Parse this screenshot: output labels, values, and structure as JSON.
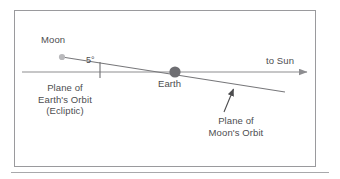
{
  "figure": {
    "kind": "astronomy-diagram",
    "colors": {
      "frame_border": "#9a9a9d",
      "bottom_rule": "#a8a8ab",
      "text": "#4d4d4f",
      "ecliptic_line": "#8d8d90",
      "moon_orbit_line": "#77777a",
      "earth_body": "#6e6e72",
      "moon_body": "#b9b9bc",
      "leader_arrow": "#4d4d4f",
      "background": "#ffffff"
    },
    "labels": {
      "moon": "Moon",
      "angle": "5°",
      "to_sun": "to Sun",
      "earth": "Earth",
      "ecliptic_line1": "Plane of",
      "ecliptic_line2": "Earth's Orbit",
      "ecliptic_line3": "(Ecliptic)",
      "moon_orbit_line1": "Plane of",
      "moon_orbit_line2": "Moon's Orbit"
    },
    "geometry": {
      "ecliptic": {
        "x1": 22,
        "y1": 72,
        "x2": 315,
        "y2": 72,
        "arrow_at": "end"
      },
      "moon_orbit": {
        "x1": 62,
        "y1": 57,
        "x2": 285,
        "y2": 92
      },
      "angle_tick": {
        "x": 100,
        "y1": 62,
        "y2": 78
      },
      "earth": {
        "cx": 175,
        "cy": 72,
        "r": 5.6
      },
      "moon": {
        "cx": 62,
        "cy": 57,
        "r": 3.1
      },
      "leader": {
        "x1": 224,
        "y1": 112,
        "x2": 233,
        "y2": 87
      },
      "inclination_degrees": 5
    }
  }
}
